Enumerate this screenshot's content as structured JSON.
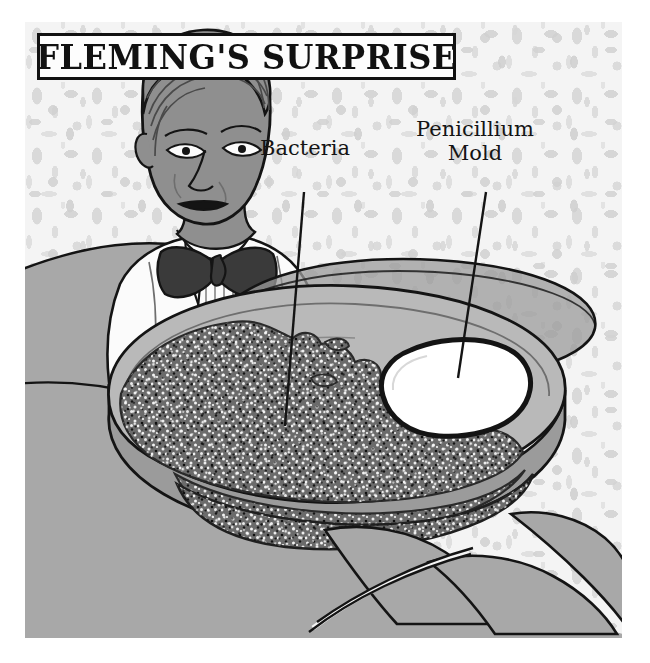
{
  "illustration": {
    "title": "FLEMING'S SURPRISE",
    "subject": "alexander-fleming-penicillin-discovery",
    "labels": {
      "bacteria": "Bacteria",
      "mold": "Penicillium\nMold"
    }
  },
  "colors": {
    "paper": "#ffffff",
    "wallpaper": "#ebebeb",
    "wallpaper_motif": "#d2d2d2",
    "ink": "#111111",
    "skin_gray": "#8f8f8f",
    "coat_white": "#fbfbfb",
    "bowtie_dark": "#3a3a3a",
    "foreground_gray": "#a8a8a8",
    "dish_rim_gray": "#8d8d8d",
    "agar_gray": "#b9b9b9",
    "bacteria_gray": "#6b6b6b",
    "mold_white": "#ffffff"
  }
}
